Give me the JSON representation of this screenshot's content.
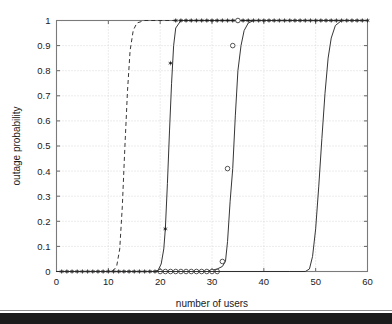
{
  "chart_data": {
    "type": "line",
    "title": "",
    "xlabel": "number of users",
    "ylabel": "outage probability",
    "xlim": [
      0,
      60
    ],
    "ylim": [
      0,
      1
    ],
    "xticks": [
      0,
      10,
      20,
      30,
      40,
      50,
      60
    ],
    "xtick_labels": [
      "0",
      "10",
      "20",
      "30",
      "40",
      "50",
      "60"
    ],
    "yticks": [
      0,
      0.1,
      0.2,
      0.3,
      0.4,
      0.5,
      0.6,
      0.7,
      0.8,
      0.9,
      1
    ],
    "ytick_labels": [
      "0",
      "0.1",
      "0.2",
      "0.3",
      "0.4",
      "0.5",
      "0.6",
      "0.7",
      "0.8",
      "0.9",
      "1"
    ],
    "grid": true,
    "grid_style": "dotted",
    "legend": null,
    "legend_position": "none",
    "line_color": "#2b2b2b",
    "grid_color": "#c8c8c8",
    "axis_color": "#7a7a7a",
    "series": [
      {
        "name": "curve-1-dashed",
        "style": "dashed",
        "marker": "none",
        "x": [
          0,
          9,
          10,
          11,
          11.6,
          12.2,
          12.7,
          13.2,
          13.7,
          14.2,
          14.8,
          15.5,
          17,
          19,
          60
        ],
        "values": [
          0,
          0,
          0,
          0.005,
          0.02,
          0.09,
          0.26,
          0.5,
          0.72,
          0.88,
          0.96,
          0.99,
          1,
          1,
          1
        ]
      },
      {
        "name": "curve-2-filled-marker",
        "style": "solid",
        "marker": "star-filled",
        "x": [
          0,
          1,
          2,
          3,
          4,
          5,
          6,
          7,
          8,
          9,
          10,
          11,
          12,
          13,
          14,
          15,
          16,
          17,
          18,
          19,
          19.6,
          20.2,
          20.7,
          21,
          21.4,
          21.8,
          22.2,
          22.6,
          23,
          24,
          26,
          28,
          30,
          32,
          34,
          36,
          38,
          40,
          42,
          44,
          46,
          48,
          50,
          52,
          54,
          56,
          58,
          60
        ],
        "values": [
          0,
          0,
          0,
          0,
          0,
          0,
          0,
          0,
          0,
          0,
          0,
          0,
          0,
          0,
          0,
          0,
          0,
          0,
          0,
          0,
          0.005,
          0.03,
          0.09,
          0.17,
          0.35,
          0.56,
          0.75,
          0.9,
          0.97,
          1,
          1,
          1,
          1,
          1,
          1,
          1,
          1,
          1,
          1,
          1,
          1,
          1,
          1,
          1,
          1,
          1,
          1,
          1
        ],
        "marker_x": [
          1,
          2,
          3,
          4,
          5,
          6,
          7,
          8,
          9,
          10,
          11,
          12,
          13,
          14,
          15,
          16,
          17,
          18,
          19,
          20,
          21,
          22,
          23,
          24,
          25,
          26,
          27,
          28,
          29,
          30,
          31,
          32,
          33,
          34,
          35,
          36,
          37,
          38,
          39,
          40,
          41,
          42,
          43,
          44,
          45,
          46,
          47,
          48,
          49,
          50,
          51,
          52,
          53,
          54,
          55,
          56,
          57,
          58,
          59,
          60
        ],
        "marker_y": [
          0,
          0,
          0,
          0,
          0,
          0,
          0,
          0,
          0,
          0,
          0,
          0,
          0,
          0,
          0,
          0,
          0,
          0,
          0,
          0,
          0.17,
          0.83,
          1,
          1,
          1,
          1,
          1,
          1,
          1,
          1,
          1,
          1,
          1,
          1,
          1,
          1,
          1,
          1,
          1,
          1,
          1,
          1,
          1,
          1,
          1,
          1,
          1,
          1,
          1,
          1,
          1,
          1,
          1,
          1,
          1,
          1,
          1,
          1,
          1,
          1
        ]
      },
      {
        "name": "curve-3-open-circle",
        "style": "solid",
        "marker": "circle-open",
        "x": [
          0,
          20,
          22,
          24,
          26,
          28,
          30,
          31,
          32,
          32.6,
          33,
          33.5,
          34,
          34.5,
          35,
          35.6,
          36.2,
          37,
          38,
          40,
          45,
          50,
          55,
          60
        ],
        "values": [
          0,
          0,
          0,
          0,
          0,
          0,
          0.005,
          0.01,
          0.02,
          0.04,
          0.12,
          0.28,
          0.41,
          0.62,
          0.8,
          0.9,
          0.96,
          0.99,
          1,
          1,
          1,
          1,
          1,
          1
        ],
        "marker_x": [
          20,
          21,
          22,
          23,
          24,
          25,
          26,
          27,
          28,
          29,
          30,
          31,
          32,
          33,
          34,
          35
        ],
        "marker_y": [
          0,
          0,
          0,
          0,
          0,
          0,
          0,
          0,
          0,
          0,
          0,
          0,
          0.04,
          0.41,
          0.9,
          1
        ]
      },
      {
        "name": "curve-4-plain",
        "style": "solid",
        "marker": "none",
        "x": [
          0,
          45,
          48,
          48.8,
          49.4,
          50,
          50.6,
          51.2,
          51.8,
          52.4,
          53,
          53.8,
          55,
          57,
          60
        ],
        "values": [
          0,
          0,
          0,
          0.01,
          0.06,
          0.17,
          0.34,
          0.53,
          0.71,
          0.85,
          0.93,
          0.98,
          1,
          1,
          1
        ]
      }
    ]
  },
  "figure": {
    "background_color": "#ffffff",
    "bottom_band_color": "#1b1b1b"
  }
}
